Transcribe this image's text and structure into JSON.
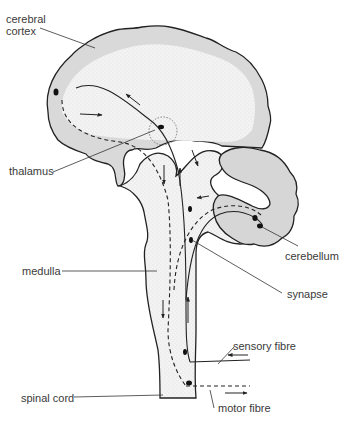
{
  "diagram": {
    "colors": {
      "outline": "#222222",
      "cortex_fill": "#d9d9d9",
      "stipple_fill": "#f1f1f1",
      "cerebellum_fill": "#d6d6d6",
      "label_text": "#3a3a3a"
    },
    "labels": {
      "cerebral_cortex_line1": "cerebral",
      "cerebral_cortex_line2": "cortex",
      "thalamus": "thalamus",
      "cerebellum": "cerebellum",
      "medulla": "medulla",
      "synapse": "synapse",
      "sensory_fibre": "sensory fibre",
      "spinal_cord": "spinal cord",
      "motor_fibre": "motor fibre"
    },
    "structures": [
      "cerebral-cortex",
      "thalamus",
      "cerebellum",
      "medulla",
      "spinal-cord",
      "sensory-fibre",
      "motor-fibre",
      "synapse"
    ],
    "legend": {
      "solid_line": "sensory pathway",
      "dashed_line": "motor pathway"
    }
  }
}
